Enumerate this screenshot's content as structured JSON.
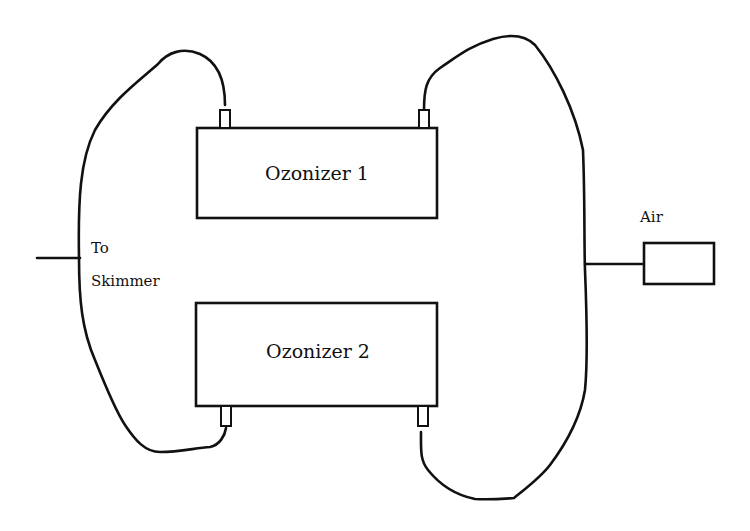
{
  "diagram": {
    "type": "ozonizer plumbing schematic",
    "labels": {
      "ozonizer_1": "Ozonizer 1",
      "ozonizer_2": "Ozonizer 2",
      "outlet_line1": "To",
      "outlet_line2": "Skimmer",
      "air": "Air"
    },
    "components": [
      {
        "id": "ozonizer-1",
        "label": "Ozonizer 1"
      },
      {
        "id": "ozonizer-2",
        "label": "Ozonizer 2"
      },
      {
        "id": "air-pump",
        "label": "Air"
      },
      {
        "id": "skimmer-outlet",
        "label": "To Skimmer"
      }
    ],
    "colors": {
      "stroke": "#111111",
      "background": "#ffffff"
    }
  }
}
